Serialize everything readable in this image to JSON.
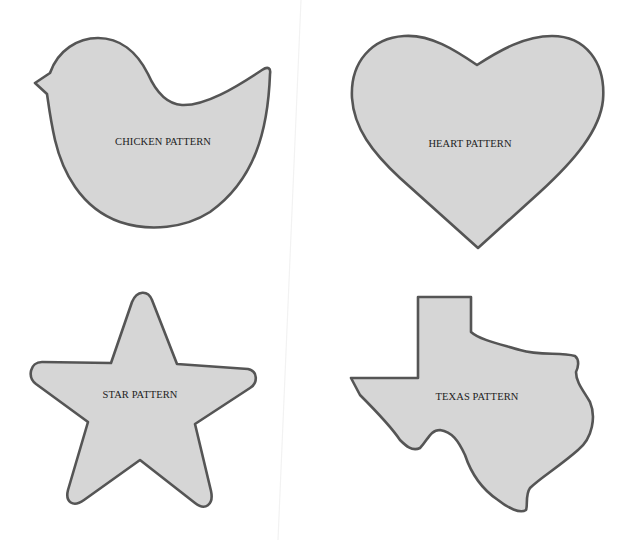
{
  "colors": {
    "background": "#ffffff",
    "shape_fill": "#d6d6d6",
    "shape_outline": "#555555",
    "label_text": "#222222"
  },
  "patterns": [
    {
      "id": "chicken",
      "label": "CHICKEN PATTERN",
      "shape": "chicken"
    },
    {
      "id": "heart",
      "label": "HEART PATTERN",
      "shape": "heart"
    },
    {
      "id": "star",
      "label": "STAR PATTERN",
      "shape": "star"
    },
    {
      "id": "texas",
      "label": "TEXAS PATTERN",
      "shape": "texas-state"
    }
  ]
}
